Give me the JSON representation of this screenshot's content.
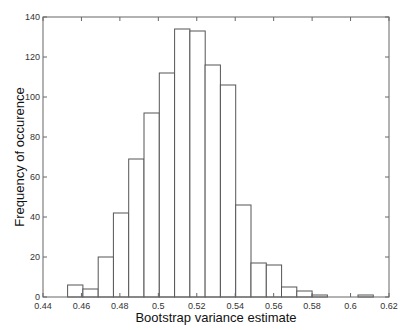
{
  "chart_data": {
    "type": "bar",
    "title": "",
    "xlabel": "Bootstrap variance estimate",
    "ylabel": "Frequency of occurence",
    "xlim": [
      0.44,
      0.62
    ],
    "ylim": [
      0,
      140
    ],
    "grid": false,
    "legend": null,
    "xticks": [
      "0.44",
      "0.46",
      "0.48",
      "0.5",
      "0.52",
      "0.54",
      "0.56",
      "0.58",
      "0.6",
      "0.62"
    ],
    "yticks": [
      "0",
      "20",
      "40",
      "60",
      "80",
      "100",
      "120",
      "140"
    ],
    "bin_start": 0.4528,
    "bin_width": 0.00795,
    "bin_centers": [
      0.4568,
      0.4647,
      0.4727,
      0.4806,
      0.4886,
      0.4965,
      0.5045,
      0.5124,
      0.5204,
      0.5283,
      0.5363,
      0.5442,
      0.5522,
      0.5601,
      0.5681,
      0.576,
      0.584,
      0.5919,
      0.5999,
      0.6078
    ],
    "values": [
      6,
      4,
      20,
      42,
      69,
      92,
      112,
      134,
      133,
      116,
      106,
      46,
      17,
      16,
      5,
      3,
      1,
      0,
      0,
      1
    ]
  },
  "colors": {
    "bar_fill": "#ffffff",
    "bar_edge": "#555555",
    "axis": "#666666",
    "text": "#222222"
  }
}
